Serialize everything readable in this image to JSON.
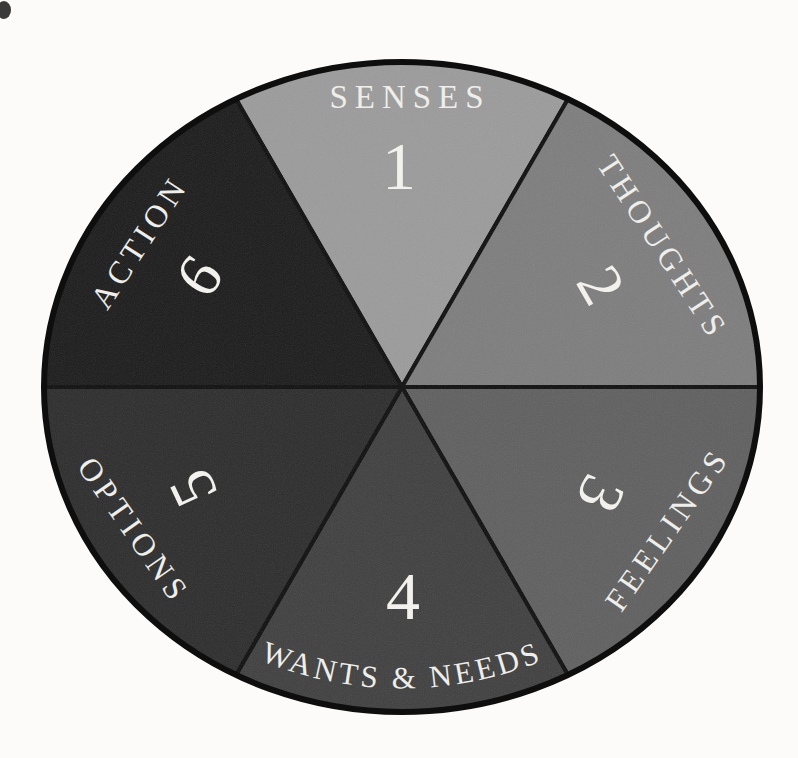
{
  "wheel": {
    "title": "awareness wheel diagram",
    "outline_color": "#0e0e0e",
    "label_color": "#efeeea",
    "segments": [
      {
        "number": "1",
        "label": "SENSES",
        "color": "#9b9b9b"
      },
      {
        "number": "2",
        "label": "THOUGHTS",
        "color": "#7d7d7d"
      },
      {
        "number": "3",
        "label": "FEELINGS",
        "color": "#5f5f5f"
      },
      {
        "number": "4",
        "label": "WANTS & NEEDS",
        "color": "#3f3f3f"
      },
      {
        "number": "5",
        "label": "OPTIONS",
        "color": "#2c2c2c"
      },
      {
        "number": "6",
        "label": "ACTION",
        "color": "#1b1b1b"
      }
    ]
  }
}
